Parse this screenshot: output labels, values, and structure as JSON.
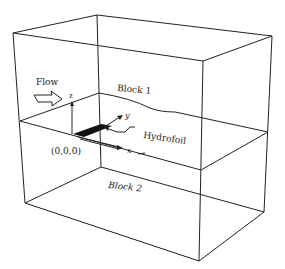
{
  "labels": {
    "flow": "Flow",
    "block1": "Block 1",
    "block2": "Block 2",
    "hydrofoil": "Hydrofoil",
    "origin": "(0,0,0)",
    "axis_x": "x",
    "axis_y": "y",
    "axis_z": "z"
  },
  "colors": {
    "line": "#222222",
    "hydrofoil": "#111111",
    "background": "#ffffff"
  }
}
